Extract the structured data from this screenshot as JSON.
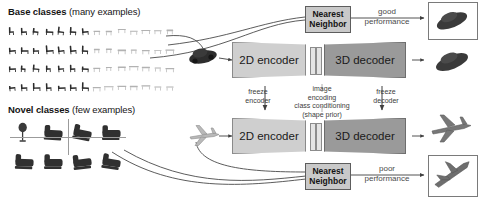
{
  "figure": {
    "type": "pipeline-diagram",
    "title_base": {
      "bold": "Base classes",
      "normal": " (many examples)"
    },
    "title_novel": {
      "bold": "Novel classes",
      "normal": " (few examples)"
    }
  },
  "left_panel": {
    "base_classes": {
      "label_bold": "Base classes",
      "label_normal": "(many examples)",
      "grid_rows": 4,
      "grid_cols": 14,
      "content_desc": "chair and table thumbnails"
    },
    "novel_classes": {
      "label_bold": "Novel classes",
      "label_normal": "(few examples)",
      "grid_rows": 2,
      "grid_cols": 4,
      "content_desc": "lamp and sofa thumbnails"
    }
  },
  "pipeline_top": {
    "encoder_label": "2D encoder",
    "decoder_label": "3D decoder",
    "input_object": "car",
    "output_object": "car"
  },
  "pipeline_bottom": {
    "encoder_label": "2D encoder",
    "decoder_label": "3D decoder",
    "input_object": "airplane",
    "output_object": "airplane"
  },
  "annotations": {
    "freeze_encoder": "freeze\nencoder",
    "freeze_encoder_line1": "freeze",
    "freeze_encoder_line2": "encoder",
    "freeze_decoder_line1": "freeze",
    "freeze_decoder_line2": "decoder",
    "image_encoding_line1": "image",
    "image_encoding_line2": "encoding",
    "class_conditioning_line1": "class conditioning",
    "class_conditioning_line2": "(shape prior)"
  },
  "nearest_neighbor_top": {
    "line1": "Nearest",
    "line2": "Neighbor",
    "result_line1": "good",
    "result_line2": "performance"
  },
  "nearest_neighbor_bottom": {
    "line1": "Nearest",
    "line2": "Neighbor",
    "result_line1": "poor",
    "result_line2": "performance"
  },
  "colors": {
    "encoder_fill": "#cfcfcf",
    "decoder_fill": "#9a9a9a",
    "nn_fill": "#c9c9c9",
    "stroke": "#5d5d5d",
    "text": "#151515",
    "anno_text": "#3b3b3b"
  }
}
